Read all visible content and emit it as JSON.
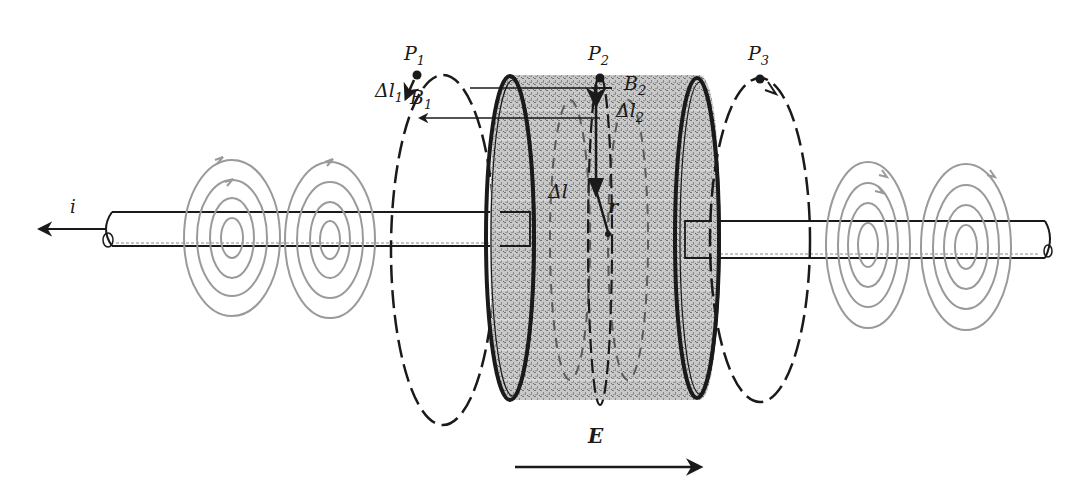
{
  "figure": {
    "colors": {
      "ink": "#1a1a1a",
      "field_rings": "#9a9a9a",
      "plate_fill": "#bdbdbd",
      "background": "#ffffff"
    },
    "labels": {
      "current": "i",
      "electric_field": "E",
      "point1": {
        "main": "P",
        "sub": "1"
      },
      "point2": {
        "main": "P",
        "sub": "2"
      },
      "point3": {
        "main": "P",
        "sub": "3"
      },
      "b1": {
        "main": "B",
        "sub": "1"
      },
      "b2": {
        "main": "B",
        "sub": "2"
      },
      "dl1": {
        "main": "Δl",
        "sub": "1"
      },
      "dl2": {
        "main": "Δl",
        "sub": "2"
      },
      "dl": "Δl",
      "r": "r"
    }
  }
}
